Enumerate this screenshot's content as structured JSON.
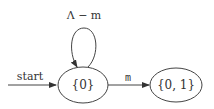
{
  "diagram": {
    "type": "finite-automaton",
    "states": [
      {
        "id": "s0",
        "label": "{0}",
        "initial": true
      },
      {
        "id": "s01",
        "label": "{0, 1}",
        "initial": false
      }
    ],
    "transitions": [
      {
        "from": "start",
        "to": "s0",
        "label": "start"
      },
      {
        "from": "s0",
        "to": "s0",
        "label": "Λ − m"
      },
      {
        "from": "s0",
        "to": "s01",
        "label": "m"
      }
    ],
    "colors": {
      "stroke": "#444444",
      "text": "#333333",
      "background": "#ffffff"
    }
  }
}
